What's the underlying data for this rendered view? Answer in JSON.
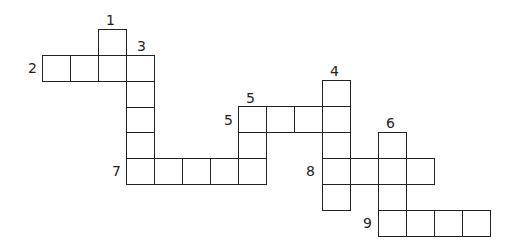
{
  "puzzle": {
    "type": "crossword",
    "cell_width": 28,
    "cell_height": 26,
    "border_color": "#222222",
    "numbers": [
      {
        "label": "1",
        "x": 106,
        "y": 13
      },
      {
        "label": "2",
        "x": 28,
        "y": 61
      },
      {
        "label": "3",
        "x": 137,
        "y": 39
      },
      {
        "label": "4",
        "x": 330,
        "y": 64
      },
      {
        "label": "5",
        "x": 246,
        "y": 91
      },
      {
        "label": "5",
        "x": 224,
        "y": 113
      },
      {
        "label": "6",
        "x": 386,
        "y": 116
      },
      {
        "label": "7",
        "x": 112,
        "y": 164
      },
      {
        "label": "8",
        "x": 306,
        "y": 164
      },
      {
        "label": "9",
        "x": 363,
        "y": 216
      }
    ],
    "words": [
      {
        "id": "1-down",
        "number": "1",
        "direction": "down",
        "length": 2,
        "cells": [
          [
            98,
            29
          ],
          [
            98,
            55
          ]
        ]
      },
      {
        "id": "2-across",
        "number": "2",
        "direction": "across",
        "length": 4,
        "cells": [
          [
            42,
            55
          ],
          [
            70,
            55
          ],
          [
            98,
            55
          ],
          [
            126,
            55
          ]
        ]
      },
      {
        "id": "3-down",
        "number": "3",
        "direction": "down",
        "length": 5,
        "cells": [
          [
            126,
            55
          ],
          [
            126,
            81
          ],
          [
            126,
            107
          ],
          [
            126,
            132
          ],
          [
            126,
            158
          ]
        ]
      },
      {
        "id": "7-across",
        "number": "7",
        "direction": "across",
        "length": 5,
        "cells": [
          [
            126,
            158
          ],
          [
            154,
            158
          ],
          [
            182,
            158
          ],
          [
            210,
            158
          ],
          [
            238,
            158
          ]
        ]
      },
      {
        "id": "5-down",
        "number": "5",
        "direction": "down",
        "length": 3,
        "cells": [
          [
            238,
            106
          ],
          [
            238,
            132
          ],
          [
            238,
            158
          ]
        ]
      },
      {
        "id": "5-across",
        "number": "5",
        "direction": "across",
        "length": 4,
        "cells": [
          [
            238,
            106
          ],
          [
            266,
            106
          ],
          [
            294,
            106
          ],
          [
            322,
            106
          ]
        ]
      },
      {
        "id": "4-down",
        "number": "4",
        "direction": "down",
        "length": 5,
        "cells": [
          [
            322,
            80
          ],
          [
            322,
            106
          ],
          [
            322,
            132
          ],
          [
            322,
            158
          ],
          [
            322,
            184
          ]
        ]
      },
      {
        "id": "8-across",
        "number": "8",
        "direction": "across",
        "length": 4,
        "cells": [
          [
            322,
            158
          ],
          [
            350,
            158
          ],
          [
            378,
            158
          ],
          [
            406,
            158
          ]
        ]
      },
      {
        "id": "6-down",
        "number": "6",
        "direction": "down",
        "length": 4,
        "cells": [
          [
            378,
            132
          ],
          [
            378,
            158
          ],
          [
            378,
            184
          ],
          [
            378,
            210
          ]
        ]
      },
      {
        "id": "9-across",
        "number": "9",
        "direction": "across",
        "length": 4,
        "cells": [
          [
            378,
            210
          ],
          [
            406,
            210
          ],
          [
            434,
            210
          ],
          [
            462,
            210
          ]
        ]
      }
    ]
  }
}
